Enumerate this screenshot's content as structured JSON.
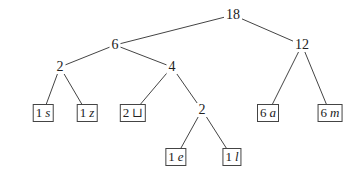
{
  "tree": {
    "title": "",
    "internal_nodes": [
      {
        "id": "root",
        "label": "18",
        "x": 233,
        "y": 15
      },
      {
        "id": "n6",
        "label": "6",
        "x": 115,
        "y": 45
      },
      {
        "id": "n12",
        "label": "12",
        "x": 302,
        "y": 45
      },
      {
        "id": "n2a",
        "label": "2",
        "x": 60,
        "y": 67
      },
      {
        "id": "n4",
        "label": "4",
        "x": 172,
        "y": 67
      },
      {
        "id": "n2b",
        "label": "2",
        "x": 202,
        "y": 110
      }
    ],
    "leaves": [
      {
        "id": "s",
        "count": "1",
        "symbol": "s",
        "x": 43,
        "y": 113
      },
      {
        "id": "z",
        "count": "1",
        "symbol": "z",
        "x": 87,
        "y": 113
      },
      {
        "id": "space",
        "count": "2",
        "symbol": "⊔",
        "x": 133,
        "y": 113
      },
      {
        "id": "a",
        "count": "6",
        "symbol": "a",
        "x": 268,
        "y": 113
      },
      {
        "id": "m",
        "count": "6",
        "symbol": "m",
        "x": 330,
        "y": 113
      },
      {
        "id": "e",
        "count": "1",
        "symbol": "e",
        "x": 176,
        "y": 157
      },
      {
        "id": "l",
        "count": "1",
        "symbol": "l",
        "x": 232,
        "y": 157
      }
    ],
    "edges": [
      [
        "root",
        "n6"
      ],
      [
        "root",
        "n12"
      ],
      [
        "n6",
        "n2a"
      ],
      [
        "n6",
        "n4"
      ],
      [
        "n2a",
        "s"
      ],
      [
        "n2a",
        "z"
      ],
      [
        "n4",
        "space"
      ],
      [
        "n4",
        "n2b"
      ],
      [
        "n2b",
        "e"
      ],
      [
        "n2b",
        "l"
      ],
      [
        "n12",
        "a"
      ],
      [
        "n12",
        "m"
      ]
    ]
  }
}
